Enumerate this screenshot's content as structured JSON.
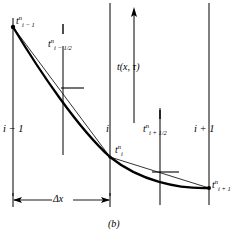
{
  "figure": {
    "caption": "(b)",
    "background_color": "#ffffff",
    "line_color": "#000000",
    "axis_label": "t(x, τ)",
    "spacing_label": "Δx",
    "node_labels": [
      {
        "name": "i-minus-1",
        "text": "i − 1",
        "x": 13,
        "y": 130
      },
      {
        "name": "i",
        "text": "i",
        "x": 110,
        "y": 130
      },
      {
        "name": "i-plus-1",
        "text": "i + 1",
        "x": 209,
        "y": 130
      }
    ],
    "point_labels": [
      {
        "name": "t-i-minus-1-n",
        "base": "t",
        "sup": "n",
        "sub": "i − 1",
        "x": 16,
        "y": 22
      },
      {
        "name": "t-i-minus-half-n",
        "base": "t",
        "sup": "n",
        "sub": "i − 1/2",
        "x": 48,
        "y": 44
      },
      {
        "name": "t-i-n",
        "base": "t",
        "sup": "n",
        "sub": "i",
        "x": 114,
        "y": 150
      },
      {
        "name": "t-i-plus-half-n",
        "base": "t",
        "sup": "n",
        "sub": "i + 1/2",
        "x": 143,
        "y": 128
      },
      {
        "name": "t-i-plus-1-n",
        "base": "t",
        "sup": "n",
        "sub": "i + 1",
        "x": 209,
        "y": 182
      }
    ],
    "grid_lines": [
      {
        "name": "node-line-i-minus-1",
        "x": 13,
        "y1": 18,
        "y2": 196
      },
      {
        "name": "half-line-i-minus-half",
        "x": 63,
        "y1": 46,
        "y2": 155
      },
      {
        "name": "node-line-i",
        "x": 110,
        "y1": 3,
        "y2": 196
      },
      {
        "name": "half-line-i-plus-half",
        "x": 160,
        "y1": 108,
        "y2": 205
      },
      {
        "name": "node-line-i-plus-1",
        "x": 209,
        "y1": 3,
        "y2": 205
      }
    ],
    "tick_marks": [
      {
        "name": "tick-above-i-minus-half",
        "x": 63,
        "y1": 24,
        "y2": 34
      },
      {
        "name": "tick-above-i-plus-half",
        "x": 160,
        "y1": 110,
        "y2": 119
      }
    ],
    "secant_ticks": [
      {
        "name": "secant-tick-left",
        "x1": 63,
        "y1": 88,
        "x2": 83,
        "y2": 88
      },
      {
        "name": "secant-tick-right",
        "x1": 153,
        "y1": 172,
        "x2": 178,
        "y2": 172
      }
    ],
    "axis_arrow": {
      "name": "t-axis-arrow",
      "x": 134,
      "y_top": 10,
      "y_bottom": 123
    },
    "dimension_arrow": {
      "name": "delta-x-dimension",
      "x1": 13,
      "x2": 110,
      "y": 200,
      "cap_top": 192,
      "cap_bottom": 208
    },
    "curve": {
      "name": "temperature-profile-curve",
      "points": [
        {
          "x": 13,
          "y": 27
        },
        {
          "x": 110,
          "y": 157
        },
        {
          "x": 209,
          "y": 188
        }
      ],
      "path": "M13,27 C40,72 78,128 110,157 C140,181 178,189 209,188"
    },
    "chords": [
      {
        "name": "chord-left",
        "x1": 13,
        "y1": 27,
        "x2": 110,
        "y2": 157
      },
      {
        "name": "chord-right",
        "x1": 110,
        "y1": 157,
        "x2": 209,
        "y2": 188
      }
    ],
    "markers": [
      {
        "name": "marker-i-minus-1",
        "x": 13,
        "y": 27
      },
      {
        "name": "marker-i",
        "x": 110,
        "y": 157
      },
      {
        "name": "marker-i-plus-1",
        "x": 209,
        "y": 188
      }
    ]
  }
}
